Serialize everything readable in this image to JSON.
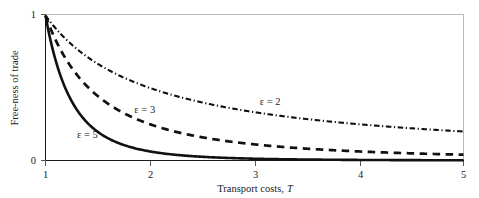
{
  "chart_data": {
    "type": "line",
    "title": "",
    "xlabel": "Transport costs, T",
    "ylabel": "Free-ness of trade",
    "xlim": [
      1,
      5
    ],
    "ylim": [
      0,
      1
    ],
    "xticks": [
      "1",
      "2",
      "3",
      "4",
      "5"
    ],
    "yticks": [
      "0",
      "1"
    ],
    "grid": false,
    "legend_position": "inline-annotations",
    "x": [
      1,
      1.1,
      1.2,
      1.3,
      1.4,
      1.5,
      1.6,
      1.7,
      1.8,
      1.9,
      2,
      2.2,
      2.4,
      2.6,
      2.8,
      3,
      3.25,
      3.5,
      3.75,
      4,
      4.25,
      4.5,
      4.75,
      5
    ],
    "series": [
      {
        "name": "epsilon = 2",
        "label": "ε = 2",
        "style": "dash-dot",
        "values": [
          1,
          0.909,
          0.833,
          0.769,
          0.714,
          0.667,
          0.625,
          0.588,
          0.556,
          0.526,
          0.5,
          0.455,
          0.417,
          0.385,
          0.357,
          0.333,
          0.308,
          0.286,
          0.267,
          0.25,
          0.235,
          0.222,
          0.211,
          0.2
        ]
      },
      {
        "name": "epsilon = 3",
        "label": "ε = 3",
        "style": "dashed",
        "values": [
          1,
          0.826,
          0.694,
          0.592,
          0.51,
          0.444,
          0.391,
          0.346,
          0.309,
          0.277,
          0.25,
          0.207,
          0.174,
          0.148,
          0.128,
          0.111,
          0.0947,
          0.0816,
          0.0711,
          0.0625,
          0.0554,
          0.0494,
          0.0443,
          0.04
        ]
      },
      {
        "name": "epsilon = 5",
        "label": "ε = 5",
        "style": "solid",
        "values": [
          1,
          0.683,
          0.482,
          0.35,
          0.26,
          0.198,
          0.153,
          0.12,
          0.0953,
          0.0767,
          0.0625,
          0.0427,
          0.0301,
          0.0219,
          0.0163,
          0.0123,
          0.00896,
          0.00666,
          0.00505,
          0.00391,
          0.00306,
          0.00244,
          0.00196,
          0.0016
        ]
      }
    ],
    "annotations": [
      {
        "text": "ε = 2",
        "x": 3.05,
        "y": 0.385
      },
      {
        "text": "ε = 3",
        "x": 1.85,
        "y": 0.33
      },
      {
        "text": "ε = 5",
        "x": 1.3,
        "y": 0.155
      }
    ]
  },
  "axes": {
    "y_top_label": "1",
    "y_bottom_label": "0",
    "y_title": "Free-ness of trade",
    "x_title_main": "Transport costs,",
    "x_title_symbol": "T",
    "x_tick_1": "1",
    "x_tick_2": "2",
    "x_tick_3": "3",
    "x_tick_4": "4",
    "x_tick_5": "5"
  },
  "labels": {
    "eps2": "ε = 2",
    "eps3": "ε = 3",
    "eps5": "ε = 5"
  },
  "colors": {
    "curve": "#111111",
    "axis": "#1a1a1a",
    "frame": "#b9b9b9",
    "background": "#ffffff"
  }
}
